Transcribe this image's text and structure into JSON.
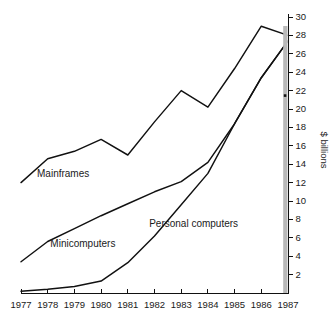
{
  "chart_data": {
    "type": "line",
    "title": "",
    "subtitle": "",
    "xlabel": "",
    "ylabel": "$ billions",
    "x": [
      1977,
      1978,
      1979,
      1980,
      1981,
      1982,
      1983,
      1984,
      1985,
      1986,
      1987
    ],
    "categories": [
      "1977",
      "1978",
      "1979",
      "1980",
      "1981",
      "1982",
      "1983",
      "1984",
      "1985",
      "1986",
      "1987"
    ],
    "xlim": [
      1977,
      1987
    ],
    "ylim": [
      0,
      30
    ],
    "y_ticks": [
      2,
      4,
      6,
      8,
      10,
      12,
      14,
      16,
      18,
      20,
      22,
      24,
      26,
      28,
      30
    ],
    "y_tick_labels": [
      "2",
      "4",
      "6",
      "8",
      "10",
      "12",
      "14",
      "16",
      "18",
      "20",
      "22",
      "24",
      "26",
      "28",
      "30"
    ],
    "y_axis_position": "right",
    "grid": false,
    "legend": "inline-labels",
    "series": [
      {
        "name": "Mainframes",
        "label_position": {
          "x": 1977.6,
          "y": 12.6
        },
        "values": [
          12.0,
          14.6,
          15.4,
          16.7,
          15.0,
          18.6,
          22.0,
          20.2,
          24.4,
          29.0,
          28.0
        ]
      },
      {
        "name": "Minicomputers",
        "label_position": {
          "x": 1978.1,
          "y": 5.0
        },
        "values": [
          3.4,
          5.6,
          7.0,
          8.4,
          9.7,
          11.0,
          12.1,
          14.2,
          18.4,
          23.4,
          27.4
        ]
      },
      {
        "name": "Personal computers",
        "label_position": {
          "x": 1981.8,
          "y": 7.2
        },
        "values": [
          0.2,
          0.4,
          0.7,
          1.3,
          3.3,
          6.2,
          9.6,
          13.0,
          18.4,
          23.4,
          27.4
        ]
      }
    ]
  },
  "axis": {
    "y_title": "$ billions"
  }
}
